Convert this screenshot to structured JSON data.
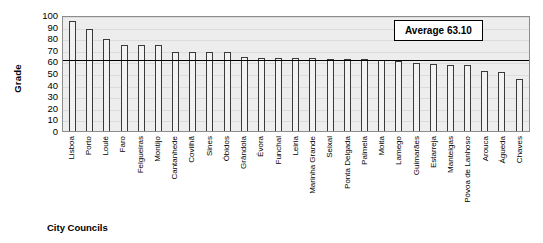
{
  "chart_data": {
    "type": "bar",
    "title": "",
    "xlabel": "City Councils",
    "ylabel": "Grade",
    "ylim": [
      0,
      100
    ],
    "ytick_step": 10,
    "yticks": [
      100,
      90,
      80,
      70,
      60,
      50,
      40,
      30,
      20,
      10,
      0
    ],
    "grid": true,
    "legend": false,
    "annotation": "Average 63.10",
    "average_value": 63.1,
    "bar_color": "#f2f2f2",
    "bar_edge_color": "#3a3a3a",
    "plot_background": "#ededed",
    "average_line_color": "#000000",
    "categories": [
      "Lisboa",
      "Porto",
      "Loulé",
      "Faro",
      "Felgueiras",
      "Montijo",
      "Cantanhede",
      "Covilhã",
      "Sines",
      "Óbidos",
      "Grândola",
      "Évora",
      "Funchal",
      "Leiria",
      "Marinha Grande",
      "Seixal",
      "Ponta Delgada",
      "Palmela",
      "Moita",
      "Lamego",
      "Guimarães",
      "Estarreja",
      "Manteigas",
      "Póvoa de Lanhoso",
      "Arouca",
      "Águeda",
      "Chaves"
    ],
    "values": [
      95,
      88,
      79,
      74,
      74,
      74,
      68,
      68,
      68,
      68,
      64,
      63,
      63,
      63,
      63,
      62,
      62,
      62,
      61,
      60,
      59,
      58,
      57,
      57,
      52,
      51,
      45
    ]
  },
  "annotation_box": {
    "label": "Average 63.10"
  },
  "axes": {
    "y_title": "Grade",
    "x_title": "City Councils"
  }
}
